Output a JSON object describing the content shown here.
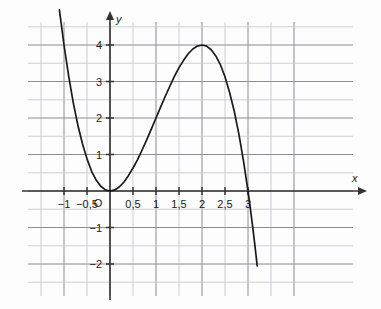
{
  "chart_data": {
    "type": "line",
    "title": "",
    "subtitle": "",
    "xlabel": "x",
    "ylabel": "y",
    "xlim": [
      -1.2,
      3.25
    ],
    "ylim": [
      -2.45,
      4.7
    ],
    "grid": true,
    "grid_step_x": 0.5,
    "grid_step_y": 0.5,
    "legend": "none",
    "origin_label": "O",
    "x_tick_labels": [
      "−1",
      "−0,5",
      "0,5",
      "1",
      "1,5",
      "2",
      "2,5",
      "3"
    ],
    "x_tick_values": [
      -1,
      -0.5,
      0.5,
      1,
      1.5,
      2,
      2.5,
      3
    ],
    "y_tick_labels": [
      "−2",
      "−1",
      "1",
      "2",
      "3",
      "4"
    ],
    "y_tick_values": [
      -2,
      -1,
      1,
      2,
      3,
      4
    ],
    "series": [
      {
        "name": "f(x) = 3x² − x³",
        "color": "#1a1a1a",
        "x": [
          -1.18,
          -1.1,
          -1.0,
          -0.9,
          -0.8,
          -0.7,
          -0.6,
          -0.5,
          -0.4,
          -0.3,
          -0.2,
          -0.1,
          0.0,
          0.1,
          0.2,
          0.3,
          0.4,
          0.5,
          0.6,
          0.7,
          0.8,
          0.9,
          1.0,
          1.1,
          1.2,
          1.3,
          1.4,
          1.5,
          1.6,
          1.7,
          1.8,
          1.9,
          2.0,
          2.1,
          2.2,
          2.3,
          2.4,
          2.5,
          2.6,
          2.7,
          2.8,
          2.9,
          3.0,
          3.05,
          3.1,
          3.15,
          3.2
        ],
        "y": [
          5.82,
          4.96,
          4.0,
          3.16,
          2.43,
          1.81,
          1.3,
          0.88,
          0.54,
          0.3,
          0.13,
          0.03,
          0.0,
          0.03,
          0.11,
          0.24,
          0.42,
          0.63,
          0.86,
          1.13,
          1.41,
          1.7,
          2.0,
          2.3,
          2.59,
          2.87,
          3.14,
          3.38,
          3.58,
          3.76,
          3.89,
          3.97,
          4.0,
          3.97,
          3.87,
          3.7,
          3.46,
          3.13,
          2.7,
          2.19,
          1.57,
          0.84,
          0.0,
          -0.47,
          -0.96,
          -1.49,
          -2.05
        ]
      }
    ],
    "annotations": [
      {
        "label": "local minimum (double root)",
        "x": 0,
        "y": 0
      },
      {
        "label": "local maximum",
        "x": 2,
        "y": 4
      },
      {
        "label": "root",
        "x": 3,
        "y": 0
      }
    ],
    "colors": {
      "curve": "#1a1a1a",
      "axis": "#333333",
      "grid_major": "#8c8c94",
      "grid_minor": "#c8c8d0",
      "background": "#fdfdfd",
      "text": "#1b1b1b"
    }
  }
}
